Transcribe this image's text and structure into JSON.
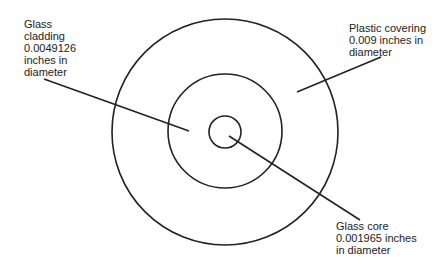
{
  "diagram": {
    "type": "concentric-cross-section",
    "stroke_color": "#222222",
    "circles": [
      {
        "name": "plastic-covering",
        "cx": 225,
        "cy": 132,
        "r": 113
      },
      {
        "name": "glass-cladding",
        "cx": 225,
        "cy": 131,
        "r": 57
      },
      {
        "name": "glass-core",
        "cx": 225,
        "cy": 132,
        "r": 16
      }
    ],
    "leaders": [
      {
        "name": "cladding-leader",
        "x1": 44,
        "y1": 79,
        "x2": 189,
        "y2": 131
      },
      {
        "name": "covering-leader",
        "x1": 381,
        "y1": 57,
        "x2": 297,
        "y2": 92
      },
      {
        "name": "core-leader",
        "x1": 229,
        "y1": 136,
        "x2": 360,
        "y2": 220
      }
    ]
  },
  "labels": {
    "cladding": {
      "lines": [
        "Glass",
        "cladding",
        "0.0049126",
        "inches in",
        "diameter"
      ]
    },
    "covering": {
      "lines": [
        "Plastic covering",
        "0.009 inches in",
        "diameter"
      ]
    },
    "core": {
      "lines": [
        "Glass core",
        "0.001965 inches",
        "in diameter"
      ]
    }
  }
}
